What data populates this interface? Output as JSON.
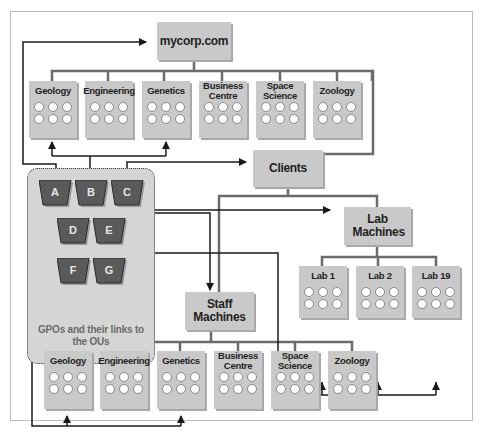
{
  "colors": {
    "box_fill": "#c9c9c9",
    "gpo_fill": "#5a5a5a",
    "panel_fill": "#d5d5d5",
    "line": "#6b6b6b",
    "arrow": "#1a1a1a"
  },
  "domain_root": {
    "label": "mycorp.com"
  },
  "top_ous": [
    {
      "label": "Geology"
    },
    {
      "label": "Engineering"
    },
    {
      "label": "Genetics"
    },
    {
      "label": "Business Centre"
    },
    {
      "label": "Space Science"
    },
    {
      "label": "Zoology"
    }
  ],
  "clients": {
    "label": "Clients"
  },
  "lab_machines": {
    "label": "Lab Machines"
  },
  "labs": [
    {
      "label": "Lab 1"
    },
    {
      "label": "Lab 2"
    },
    {
      "label": "Lab 19"
    }
  ],
  "staff_machines": {
    "label": "Staff Machines"
  },
  "staff_ous": [
    {
      "label": "Geology"
    },
    {
      "label": "Engineering"
    },
    {
      "label": "Genetics"
    },
    {
      "label": "Business Centre"
    },
    {
      "label": "Space Science"
    },
    {
      "label": "Zoology"
    }
  ],
  "gpos": [
    {
      "label": "A"
    },
    {
      "label": "B"
    },
    {
      "label": "C"
    },
    {
      "label": "D"
    },
    {
      "label": "E"
    },
    {
      "label": "F"
    },
    {
      "label": "G"
    }
  ],
  "gpo_panel": {
    "caption": "GPOs and their links to the OUs"
  }
}
